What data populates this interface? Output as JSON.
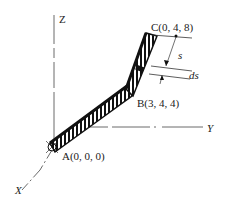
{
  "axes": {
    "z_label": "Z",
    "y_label": "Y",
    "x_label": "X"
  },
  "points": {
    "a_label": "A(0, 0, 0)",
    "b_label": "B(3, 4, 4)",
    "c_label": "C(0, 4, 8)"
  },
  "annotations": {
    "s_label": "s",
    "ds_label": "ds"
  },
  "colors": {
    "line": "#333333",
    "rod": "#111111"
  }
}
